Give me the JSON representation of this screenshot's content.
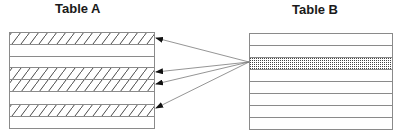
{
  "diagram": {
    "table_a": {
      "title": "Table A",
      "rows": [
        {
          "index": 1,
          "style": "hatched"
        },
        {
          "index": 2,
          "style": "blank"
        },
        {
          "index": 3,
          "style": "blank"
        },
        {
          "index": 4,
          "style": "hatched"
        },
        {
          "index": 5,
          "style": "hatched"
        },
        {
          "index": 6,
          "style": "blank"
        },
        {
          "index": 7,
          "style": "hatched"
        },
        {
          "index": 8,
          "style": "blank"
        }
      ]
    },
    "table_b": {
      "title": "Table B",
      "rows": [
        {
          "index": 1,
          "style": "blank"
        },
        {
          "index": 2,
          "style": "blank"
        },
        {
          "index": 3,
          "style": "dotted"
        },
        {
          "index": 4,
          "style": "blank"
        },
        {
          "index": 5,
          "style": "blank"
        },
        {
          "index": 6,
          "style": "blank"
        },
        {
          "index": 7,
          "style": "blank"
        },
        {
          "index": 8,
          "style": "blank"
        }
      ]
    },
    "arrows": {
      "from": "table_b.row_3",
      "to": [
        "table_a.row_1",
        "table_a.row_4",
        "table_a.row_5",
        "table_a.row_7"
      ]
    },
    "colors": {
      "line": "#8a8a8a",
      "hatch": "#333333",
      "dots": "#444444",
      "arrow": "#7a7a7a",
      "title": "#1a1a1a"
    }
  }
}
